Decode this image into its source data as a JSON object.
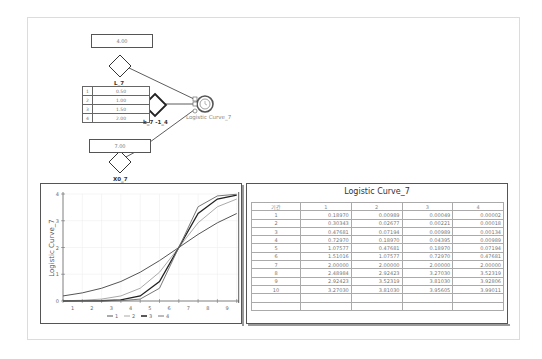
{
  "diagram": {
    "nodes": {
      "L": {
        "name": "L_7",
        "value": "4.00"
      },
      "k": {
        "name": "k_7 -1_4",
        "values": [
          {
            "idx": "1",
            "value": "0.50"
          },
          {
            "idx": "2",
            "value": "1.00"
          },
          {
            "idx": "3",
            "value": "1.50"
          },
          {
            "idx": "4",
            "value": "2.00"
          }
        ]
      },
      "X0": {
        "name": "X0_7",
        "value": "7.00"
      },
      "output": {
        "name": "Logistic Curve_7"
      }
    }
  },
  "chart_data": {
    "type": "line",
    "title": "",
    "xlabel": "",
    "ylabel": "Logistic Curve_7",
    "x": [
      1,
      2,
      3,
      4,
      5,
      6,
      7,
      8,
      9,
      10
    ],
    "x_tick_labels": [
      "1",
      "2",
      "3",
      "4",
      "5",
      "6",
      "7",
      "8",
      "9"
    ],
    "y_tick_labels": [
      "0",
      "1",
      "2",
      "3",
      "4"
    ],
    "ylim": [
      0,
      4
    ],
    "grid": true,
    "legend_position": "bottom",
    "series": [
      {
        "name": "1",
        "color": "#555555",
        "values": [
          0.1897,
          0.30343,
          0.47681,
          0.7297,
          1.07577,
          1.51016,
          2.0,
          2.48984,
          2.92423,
          3.2703
        ]
      },
      {
        "name": "2",
        "color": "#aaaaaa",
        "values": [
          0.00989,
          0.02677,
          0.07194,
          0.1897,
          0.47681,
          1.07577,
          2.0,
          2.92423,
          3.52319,
          3.8103
        ]
      },
      {
        "name": "3",
        "color": "#222222",
        "values": [
          0.00049,
          0.00221,
          0.00989,
          0.04395,
          0.1897,
          0.7297,
          2.0,
          3.2703,
          3.8103,
          3.95605
        ]
      },
      {
        "name": "4",
        "color": "#777777",
        "values": [
          2e-05,
          0.00018,
          0.00134,
          0.00989,
          0.07194,
          0.47681,
          2.0,
          3.52319,
          3.92806,
          3.99011
        ]
      }
    ]
  },
  "table": {
    "title": "Logistic Curve_7",
    "headers": [
      "기간",
      "1",
      "2",
      "3",
      "4"
    ],
    "rows": [
      [
        "1",
        "0.18970",
        "0.00989",
        "0.00049",
        "0.00002"
      ],
      [
        "2",
        "0.30343",
        "0.02677",
        "0.00221",
        "0.00018"
      ],
      [
        "3",
        "0.47681",
        "0.07194",
        "0.00989",
        "0.00134"
      ],
      [
        "4",
        "0.72970",
        "0.18970",
        "0.04395",
        "0.00989"
      ],
      [
        "5",
        "1.07577",
        "0.47681",
        "0.18970",
        "0.07194"
      ],
      [
        "6",
        "1.51016",
        "1.07577",
        "0.72970",
        "0.47681"
      ],
      [
        "7",
        "2.00000",
        "2.00000",
        "2.00000",
        "2.00000"
      ],
      [
        "8",
        "2.48984",
        "2.92423",
        "3.27030",
        "3.52319"
      ],
      [
        "9",
        "2.92423",
        "3.52319",
        "3.81030",
        "3.92806"
      ],
      [
        "10",
        "3.27030",
        "3.81030",
        "3.95605",
        "3.99011"
      ],
      [
        "",
        "",
        "",
        "",
        ""
      ],
      [
        "",
        "",
        "",
        "",
        ""
      ]
    ]
  }
}
